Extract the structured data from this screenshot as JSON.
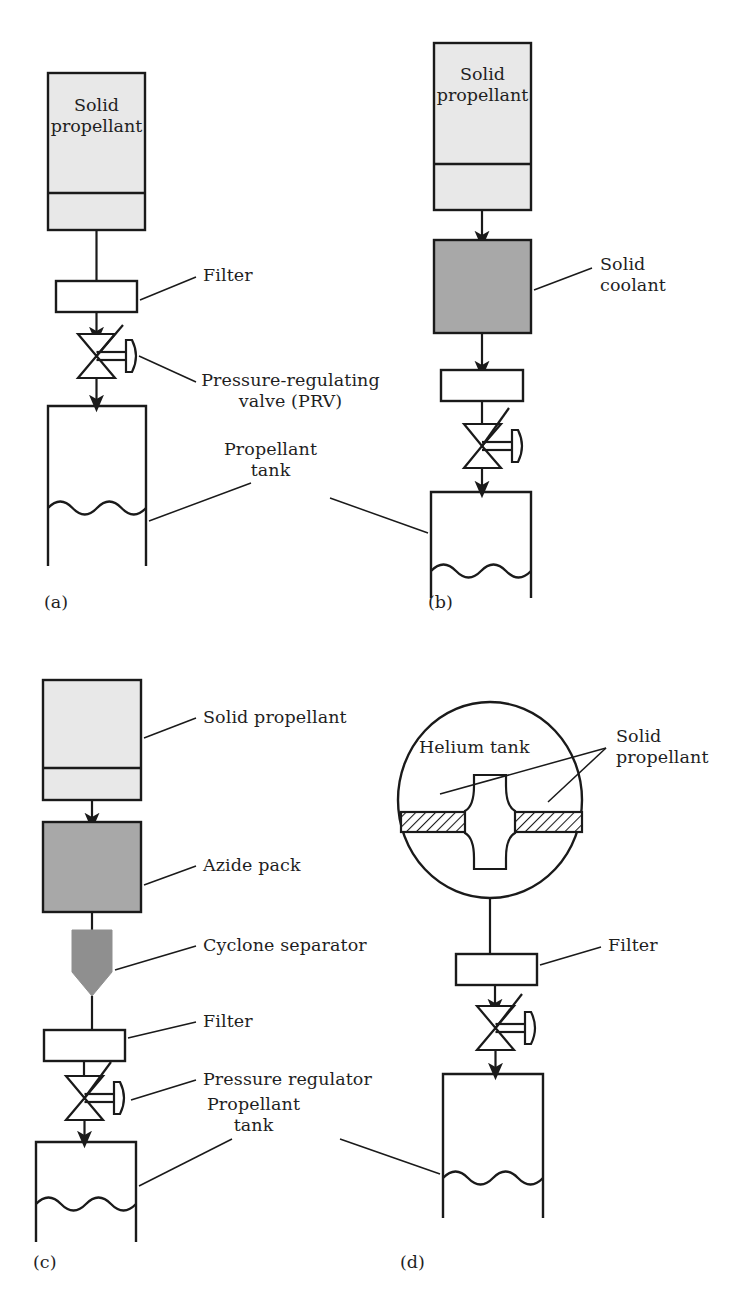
{
  "figure": {
    "type": "engineering-schematic",
    "panels": [
      {
        "id": "a",
        "caption": "(a)",
        "components": [
          "solid propellant grain",
          "filter",
          "pressure-regulating valve",
          "propellant tank"
        ],
        "labels": [
          "Filter",
          "Pressure-regulating",
          "valve (PRV)",
          "Propellant",
          "tank"
        ],
        "box_text": [
          "Solid",
          "propellant"
        ]
      },
      {
        "id": "b",
        "caption": "(b)",
        "components": [
          "solid propellant grain",
          "solid coolant",
          "filter",
          "pressure-regulating valve",
          "propellant tank"
        ],
        "labels": [
          "Solid",
          "coolant"
        ],
        "box_text": [
          "Solid",
          "propellant"
        ]
      },
      {
        "id": "c",
        "caption": "(c)",
        "components": [
          "solid propellant",
          "azide pack",
          "cyclone separator",
          "filter",
          "pressure regulator",
          "propellant tank"
        ],
        "labels": [
          "Solid propellant",
          "Azide pack",
          "Cyclone separator",
          "Filter",
          "Pressure regulator",
          "Propellant",
          "tank"
        ]
      },
      {
        "id": "d",
        "caption": "(d)",
        "components": [
          "helium tank with internal solid propellant grain",
          "filter",
          "pressure-regulating valve",
          "propellant tank"
        ],
        "labels": [
          "Helium tank",
          "Solid",
          "propellant",
          "Filter"
        ]
      }
    ]
  },
  "panel_a": {
    "caption": "(a)",
    "grain_line1": "Solid",
    "grain_line2": "propellant",
    "label_filter": "Filter",
    "label_prv_line1": "Pressure-regulating",
    "label_prv_line2": "valve (PRV)",
    "label_tank_line1": "Propellant",
    "label_tank_line2": "tank"
  },
  "panel_b": {
    "caption": "(b)",
    "grain_line1": "Solid",
    "grain_line2": "propellant",
    "label_coolant_line1": "Solid",
    "label_coolant_line2": "coolant"
  },
  "panel_c": {
    "caption": "(c)",
    "label_solid_propellant": "Solid propellant",
    "label_azide_pack": "Azide pack",
    "label_cyclone": "Cyclone separator",
    "label_filter": "Filter",
    "label_regulator": "Pressure regulator",
    "label_tank_line1": "Propellant",
    "label_tank_line2": "tank"
  },
  "panel_d": {
    "caption": "(d)",
    "label_helium_tank": "Helium tank",
    "label_solid_line1": "Solid",
    "label_solid_line2": "propellant",
    "label_filter": "Filter"
  },
  "colors": {
    "stroke": "#1a1a1a",
    "background": "#ffffff",
    "propellant_fill": "#e8e8e8",
    "coolant_fill": "#a8a8a8",
    "azide_fill": "#a8a8a8",
    "cyclone_fill": "#8f8f8f",
    "text": "#1f1f1f"
  }
}
